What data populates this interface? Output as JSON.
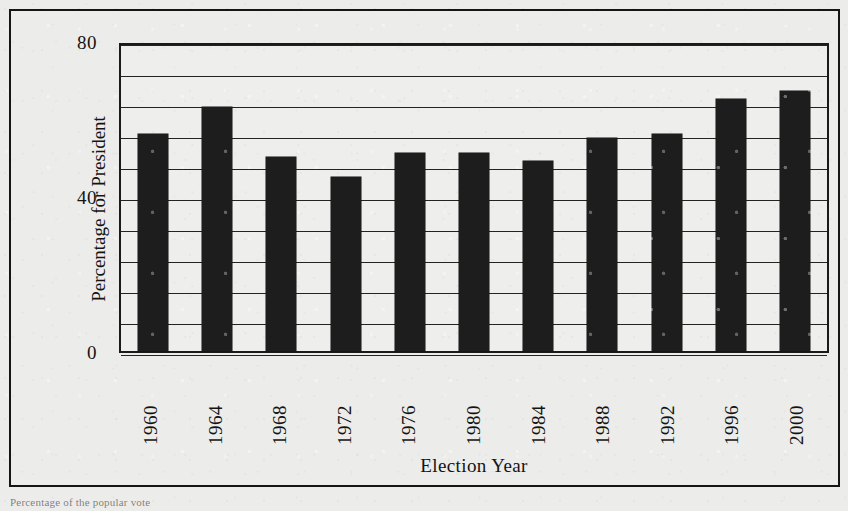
{
  "figure": {
    "frame": true,
    "caption_bleed": "Percentage of the popular vote"
  },
  "chart_data": {
    "type": "bar",
    "title": "",
    "xlabel": "Election Year",
    "ylabel": "Percentage for President",
    "categories": [
      "1960",
      "1964",
      "1968",
      "1972",
      "1976",
      "1980",
      "1984",
      "1988",
      "1992",
      "1996",
      "2000"
    ],
    "values": [
      56,
      63,
      50,
      45,
      51,
      51,
      49,
      55,
      56,
      65,
      67
    ],
    "ylim": [
      0,
      80
    ],
    "y_tick_labels": [
      "0",
      "40",
      "80"
    ],
    "y_tick_values": [
      0,
      40,
      80
    ],
    "gridline_values": [
      0,
      8,
      16,
      24,
      32,
      40,
      48,
      56,
      64,
      72,
      80
    ],
    "grid": true,
    "grid_interval": 8,
    "legend": null,
    "legend_position": "none",
    "bar_color": "#1d1d1d",
    "plot_background": "#ececea",
    "axis_color": "#1a1a1a"
  }
}
